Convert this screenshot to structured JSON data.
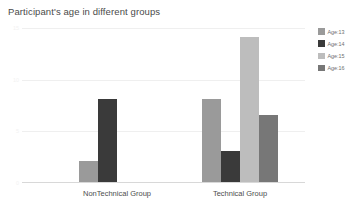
{
  "chart_data": {
    "type": "bar",
    "title": "Participant's age in different groups",
    "xlabel": "",
    "ylabel": "",
    "categories": [
      "NonTechnical Group",
      "Technical Group"
    ],
    "series": [
      {
        "name": "Age:13",
        "color": "#9a9a9a",
        "values": [
          2,
          8
        ]
      },
      {
        "name": "Age:14",
        "color": "#3a3a3a",
        "values": [
          8,
          3
        ]
      },
      {
        "name": "Age:15",
        "color": "#bdbdbd",
        "values": [
          0,
          14
        ]
      },
      {
        "name": "Age:16",
        "color": "#777777",
        "values": [
          0,
          6.5
        ]
      }
    ],
    "ylim": [
      0,
      15
    ],
    "yticks": [
      0,
      5,
      10,
      15
    ],
    "ytick_labels": [
      "0",
      "5",
      "10",
      "15"
    ],
    "grid": true,
    "legend_position": "right"
  },
  "legend": {
    "items": [
      {
        "label": "Age:13"
      },
      {
        "label": "Age:14"
      },
      {
        "label": "Age:15"
      },
      {
        "label": "Age:16"
      }
    ]
  }
}
